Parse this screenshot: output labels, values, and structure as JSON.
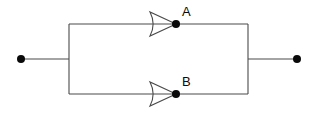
{
  "diagram": {
    "type": "electrical-network-schematic",
    "background_color": "#ffffff",
    "stroke_color": "#4a4a4a",
    "node_color": "#0a0a0a",
    "text_color": "#0a0a0a",
    "canvas": {
      "width": 314,
      "height": 117
    },
    "labels": {
      "top_node": "A",
      "bottom_node": "B"
    },
    "label_positions": {
      "top_node": {
        "x": 182,
        "y": 16
      },
      "bottom_node": {
        "x": 182,
        "y": 86
      }
    },
    "terminals": [
      {
        "name": "left-terminal",
        "x": 21,
        "y": 59,
        "radius": 4
      },
      {
        "name": "right-terminal",
        "x": 297,
        "y": 59,
        "radius": 4
      }
    ],
    "nodes": [
      {
        "name": "node-a",
        "x": 176,
        "y": 24,
        "radius": 4
      },
      {
        "name": "node-b",
        "x": 176,
        "y": 94,
        "radius": 4
      }
    ],
    "rectangle": {
      "left": 69,
      "right": 248,
      "top": 24,
      "bottom": 94
    },
    "lead_wires": [
      {
        "name": "left-lead",
        "x1": 21,
        "y1": 59,
        "x2": 69,
        "y2": 59
      },
      {
        "name": "right-lead",
        "x1": 248,
        "y1": 59,
        "x2": 297,
        "y2": 59
      }
    ],
    "elements": [
      {
        "name": "arrow-element-a",
        "shape": "right-pointing-triangle-with-concave-left-edge",
        "apex_x": 176,
        "back_x": 150,
        "center_y": 24,
        "half_height": 12
      },
      {
        "name": "arrow-element-b",
        "shape": "right-pointing-triangle-with-concave-left-edge",
        "apex_x": 176,
        "back_x": 150,
        "center_y": 94,
        "half_height": 12
      }
    ]
  }
}
